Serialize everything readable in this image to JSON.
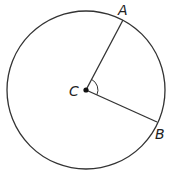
{
  "diagram": {
    "type": "circle-central-angle",
    "center": {
      "label": "C",
      "x": 86,
      "y": 90
    },
    "radius": 79,
    "points": [
      {
        "label": "A",
        "x": 123,
        "y": 20
      },
      {
        "label": "B",
        "x": 157,
        "y": 123
      }
    ],
    "segments": [
      [
        "C",
        "A"
      ],
      [
        "C",
        "B"
      ]
    ],
    "angle_mark": {
      "vertex": "C",
      "between": [
        "A",
        "B"
      ]
    },
    "stroke_color": "#333333"
  }
}
